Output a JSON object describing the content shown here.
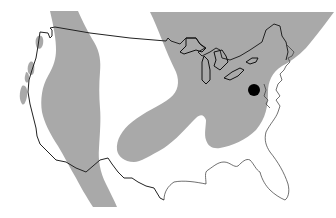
{
  "map": {
    "type": "range-map",
    "region": "Contiguous United States",
    "colors": {
      "background": "#ffffff",
      "range_fill": "#a9a9a9",
      "outline": "#222222",
      "marker": "#000000"
    },
    "layers": [
      {
        "name": "western-range",
        "description": "Gray distribution band running north-south through the western interior"
      },
      {
        "name": "pacific-coast-patches",
        "description": "Small gray patches along the Pacific coast"
      },
      {
        "name": "eastern-range",
        "description": "Large gray distribution area covering the Great Lakes, Northeast and Mid-Atlantic, with a lobe extending southwest toward the central plains"
      }
    ],
    "marker": {
      "label": "location-point",
      "description": "Black dot near the Chesapeake Bay / Mid-Atlantic region"
    }
  }
}
